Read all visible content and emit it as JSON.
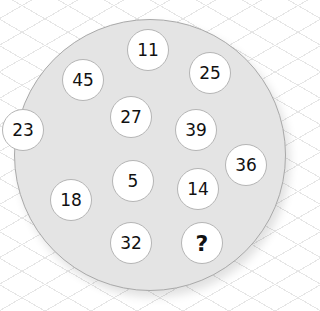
{
  "puzzle": {
    "description": "Circle of numbers with one missing value",
    "circles": [
      {
        "label": "11",
        "x": 148,
        "y": 50
      },
      {
        "label": "45",
        "x": 83,
        "y": 80
      },
      {
        "label": "25",
        "x": 210,
        "y": 73
      },
      {
        "label": "27",
        "x": 131,
        "y": 117
      },
      {
        "label": "39",
        "x": 196,
        "y": 130
      },
      {
        "label": "23",
        "x": 23,
        "y": 130
      },
      {
        "label": "36",
        "x": 246,
        "y": 165
      },
      {
        "label": "5",
        "x": 133,
        "y": 181
      },
      {
        "label": "14",
        "x": 198,
        "y": 189
      },
      {
        "label": "18",
        "x": 71,
        "y": 200
      },
      {
        "label": "32",
        "x": 131,
        "y": 243
      },
      {
        "label": "?",
        "x": 202,
        "y": 243
      }
    ]
  },
  "colors": {
    "disc": "#e4e4e4",
    "disc_border": "#a9a9a9",
    "circle": "#ffffff",
    "grid": "#e6e6e6"
  }
}
